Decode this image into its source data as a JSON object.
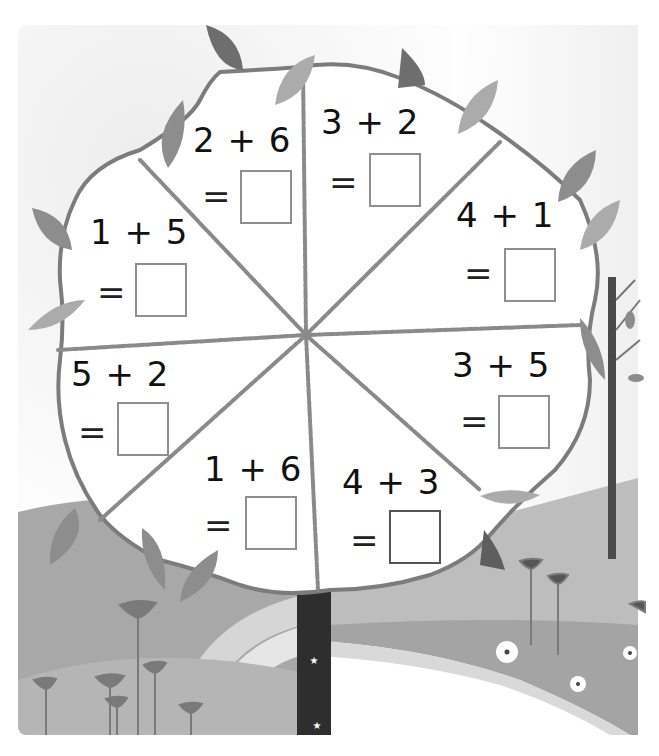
{
  "worksheet": {
    "theme": "addition-tree",
    "colors": {
      "leaf_dark": "#6e6e6e",
      "leaf_mid": "#8d8d8d",
      "leaf_light": "#ababab",
      "trunk": "#2e2e2e",
      "hill_mid": "#a5a5a5",
      "hill_light": "#c8c8c8",
      "crown_outline": "#7c7c7c",
      "answer_box_border": "#8f8f8f"
    },
    "problems": [
      {
        "expression": "2 + 6",
        "equals": "=",
        "answer": ""
      },
      {
        "expression": "3 + 2",
        "equals": "=",
        "answer": ""
      },
      {
        "expression": "1 + 5",
        "equals": "=",
        "answer": ""
      },
      {
        "expression": "4 + 1",
        "equals": "=",
        "answer": ""
      },
      {
        "expression": "5 + 2",
        "equals": "=",
        "answer": ""
      },
      {
        "expression": "3 + 5",
        "equals": "=",
        "answer": ""
      },
      {
        "expression": "1 + 6",
        "equals": "=",
        "answer": ""
      },
      {
        "expression": "4 + 3",
        "equals": "=",
        "answer": ""
      }
    ]
  }
}
